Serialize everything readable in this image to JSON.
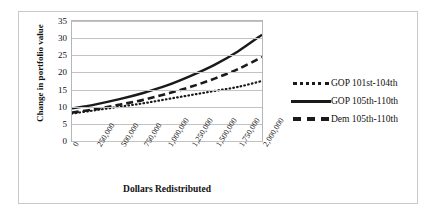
{
  "chart_data": {
    "type": "line",
    "title": "",
    "xlabel": "Dollars Redistributed",
    "ylabel": "Change in portfolio value",
    "ylim": [
      0,
      35
    ],
    "yticks": [
      0,
      5,
      10,
      15,
      20,
      25,
      30,
      35
    ],
    "grid": true,
    "legend_position": "right",
    "categories": [
      "0",
      "250,000",
      "500,000",
      "750,000",
      "1,000,000",
      "1,250,000",
      "1,500,000",
      "1,750,000",
      "2,000,000"
    ],
    "x": [
      0,
      250000,
      500000,
      750000,
      1000000,
      1250000,
      1500000,
      1750000,
      2000000
    ],
    "series": [
      {
        "name": "GOP 101st-104th",
        "style": "dotted",
        "color": "#1a1a1a",
        "values": [
          8.0,
          9.0,
          10.0,
          11.0,
          12.2,
          13.4,
          14.6,
          15.8,
          17.5
        ]
      },
      {
        "name": "GOP 105th-110th",
        "style": "solid",
        "color": "#1a1a1a",
        "values": [
          9.5,
          10.7,
          12.2,
          14.0,
          16.2,
          19.0,
          22.2,
          26.2,
          31.0
        ]
      },
      {
        "name": "Dem 105th-110th",
        "style": "dashed",
        "color": "#1a1a1a",
        "values": [
          8.3,
          9.3,
          10.6,
          12.0,
          13.8,
          15.8,
          18.2,
          21.0,
          24.5
        ]
      }
    ]
  },
  "legend": {
    "items": [
      {
        "label": "GOP 101st-104th",
        "style": "dotted"
      },
      {
        "label": "GOP 105th-110th",
        "style": "solid"
      },
      {
        "label": "Dem 105th-110th",
        "style": "dashed"
      }
    ]
  }
}
